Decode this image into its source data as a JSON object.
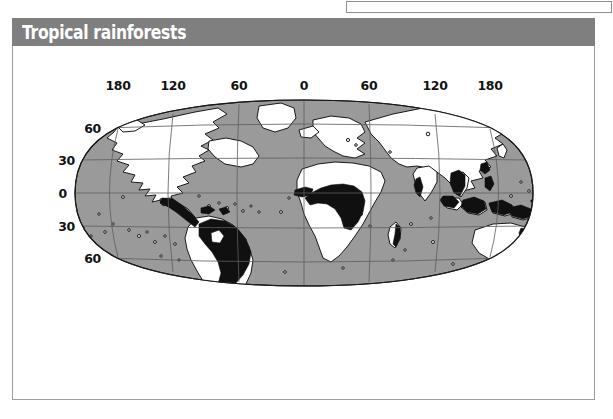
{
  "title": "Tropical rainforests",
  "map": {
    "projection": "robinson",
    "ocean_color": "#9a9a9a",
    "land_color": "#ffffff",
    "rainforest_color": "#111111",
    "graticule_color": "#6b6b6b",
    "outline_color": "#1a1a1a",
    "longitude_labels": [
      "180",
      "120",
      "60",
      "0",
      "60",
      "120",
      "180"
    ],
    "latitude_labels": [
      "60",
      "30",
      "0",
      "30",
      "60"
    ],
    "legend_note": "",
    "rainforest_regions": [
      "Central America",
      "Amazon Basin",
      "Congo Basin",
      "West Africa",
      "Madagascar east coast",
      "Western Ghats India",
      "Southeast Asia mainland",
      "Indonesia",
      "New Guinea",
      "Northeast Australia"
    ]
  },
  "theme": {
    "title_bar_color": "#7f7f7f",
    "title_text_color": "#ffffff",
    "panel_border_color": "#9d9d9d",
    "page_background": "#ffffff"
  }
}
